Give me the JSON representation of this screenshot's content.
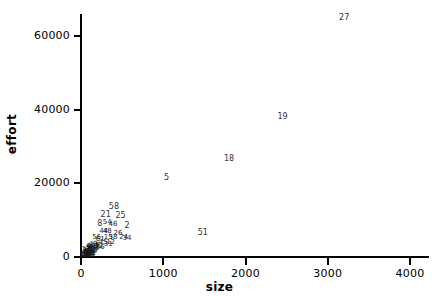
{
  "chart_data": {
    "type": "scatter",
    "title": "",
    "xlabel": "size",
    "ylabel": "effort",
    "xlim": [
      0,
      4200
    ],
    "ylim": [
      0,
      67000
    ],
    "grid": false,
    "legend": null,
    "point_label_field": "id",
    "xticks": [
      {
        "value": 0,
        "label": "0"
      },
      {
        "value": 1000,
        "label": "1000"
      },
      {
        "value": 2000,
        "label": "2000"
      },
      {
        "value": 3000,
        "label": "3000"
      },
      {
        "value": 4000,
        "label": "4000"
      }
    ],
    "yticks": [
      {
        "value": 0,
        "label": "0"
      },
      {
        "value": 20000,
        "label": "20000"
      },
      {
        "value": 40000,
        "label": "40000"
      },
      {
        "value": 60000,
        "label": "60000"
      }
    ],
    "points": [
      {
        "id": "27",
        "x": 3200,
        "y": 65000
      },
      {
        "id": "19",
        "x": 2450,
        "y": 38000
      },
      {
        "id": "18",
        "x": 1800,
        "y": 26500
      },
      {
        "id": "5",
        "x": 1040,
        "y": 21500
      },
      {
        "id": "51",
        "x": 1480,
        "y": 6500
      },
      {
        "id": "58",
        "x": 400,
        "y": 13500
      },
      {
        "id": "21",
        "x": 300,
        "y": 11500
      },
      {
        "id": "25",
        "x": 480,
        "y": 11000
      },
      {
        "id": "8",
        "x": 230,
        "y": 9000
      },
      {
        "id": "54",
        "x": 320,
        "y": 9500
      },
      {
        "id": "46",
        "x": 390,
        "y": 9000
      },
      {
        "id": "2",
        "x": 560,
        "y": 8500
      },
      {
        "id": "44",
        "x": 275,
        "y": 7000
      },
      {
        "id": "48",
        "x": 320,
        "y": 7000
      },
      {
        "id": "26",
        "x": 450,
        "y": 6500
      },
      {
        "id": "56",
        "x": 190,
        "y": 5500
      },
      {
        "id": "61",
        "x": 235,
        "y": 5000
      },
      {
        "id": "15",
        "x": 330,
        "y": 5500
      },
      {
        "id": "38",
        "x": 390,
        "y": 5500
      },
      {
        "id": "24",
        "x": 520,
        "y": 5500
      },
      {
        "id": "34",
        "x": 560,
        "y": 5200
      },
      {
        "id": "31",
        "x": 330,
        "y": 3500
      },
      {
        "id": "45",
        "x": 270,
        "y": 4000
      },
      {
        "id": "12",
        "x": 360,
        "y": 4200
      },
      {
        "id": "43",
        "x": 150,
        "y": 3500
      },
      {
        "id": "60",
        "x": 120,
        "y": 3000
      },
      {
        "id": "49",
        "x": 175,
        "y": 3200
      },
      {
        "id": "9",
        "x": 100,
        "y": 2600
      },
      {
        "id": "40",
        "x": 145,
        "y": 2600
      },
      {
        "id": "3",
        "x": 190,
        "y": 2900
      },
      {
        "id": "22",
        "x": 215,
        "y": 3000
      },
      {
        "id": "7",
        "x": 85,
        "y": 2400
      },
      {
        "id": "33",
        "x": 130,
        "y": 2300
      },
      {
        "id": "53",
        "x": 165,
        "y": 2500
      },
      {
        "id": "11",
        "x": 60,
        "y": 2200
      },
      {
        "id": "29",
        "x": 105,
        "y": 2100
      },
      {
        "id": "36",
        "x": 235,
        "y": 2600
      },
      {
        "id": "17",
        "x": 75,
        "y": 1900
      },
      {
        "id": "42",
        "x": 125,
        "y": 1800
      },
      {
        "id": "57",
        "x": 160,
        "y": 2000
      },
      {
        "id": "4",
        "x": 55,
        "y": 1600
      },
      {
        "id": "30",
        "x": 95,
        "y": 1500
      },
      {
        "id": "50",
        "x": 140,
        "y": 1700
      },
      {
        "id": "1",
        "x": 40,
        "y": 1400
      },
      {
        "id": "23",
        "x": 80,
        "y": 1300
      },
      {
        "id": "39",
        "x": 115,
        "y": 1400
      },
      {
        "id": "6",
        "x": 50,
        "y": 1100
      },
      {
        "id": "35",
        "x": 90,
        "y": 1100
      },
      {
        "id": "52",
        "x": 130,
        "y": 1200
      },
      {
        "id": "13",
        "x": 35,
        "y": 900
      },
      {
        "id": "28",
        "x": 70,
        "y": 900
      },
      {
        "id": "47",
        "x": 105,
        "y": 1000
      },
      {
        "id": "10",
        "x": 45,
        "y": 700
      },
      {
        "id": "32",
        "x": 85,
        "y": 700
      },
      {
        "id": "55",
        "x": 120,
        "y": 800
      },
      {
        "id": "14",
        "x": 30,
        "y": 600
      },
      {
        "id": "20",
        "x": 60,
        "y": 550
      },
      {
        "id": "41",
        "x": 100,
        "y": 600
      },
      {
        "id": "16",
        "x": 40,
        "y": 450
      },
      {
        "id": "37",
        "x": 75,
        "y": 450
      },
      {
        "id": "59",
        "x": 110,
        "y": 500
      }
    ]
  }
}
